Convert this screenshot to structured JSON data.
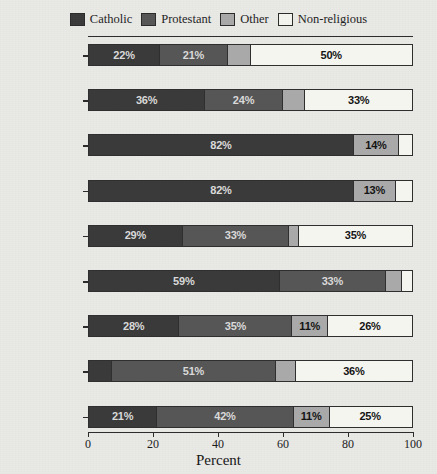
{
  "chart_data": {
    "type": "bar",
    "orientation": "horizontal",
    "stacked": true,
    "stack_mode": "percent",
    "title": "",
    "xlabel": "Percent",
    "ylabel": "",
    "xlim": [
      0,
      100
    ],
    "xticks": [
      "0",
      "20",
      "40",
      "60",
      "80",
      "100"
    ],
    "grid": false,
    "legend_position": "top",
    "categories": [
      "United States",
      "Switzerland",
      "Portugal",
      "Italy",
      "Germany",
      "France",
      "Canada",
      "Britain",
      "Australia"
    ],
    "series": [
      {
        "name": "Catholic",
        "color": "#3a3a3a",
        "values": [
          22,
          36,
          82,
          82,
          29,
          59,
          28,
          7,
          21
        ],
        "labels": [
          "22%",
          "36%",
          "82%",
          "82%",
          "29%",
          "59%",
          "28%",
          "",
          "21%"
        ]
      },
      {
        "name": "Protestant",
        "color": "#565656",
        "values": [
          21,
          24,
          0,
          0,
          33,
          33,
          35,
          51,
          42
        ],
        "labels": [
          "21%",
          "24%",
          "",
          "",
          "33%",
          "33%",
          "35%",
          "51%",
          "42%"
        ]
      },
      {
        "name": "Other",
        "color": "#a9a9a9",
        "values": [
          7,
          7,
          14,
          13,
          3,
          5,
          11,
          6,
          11
        ],
        "labels": [
          "",
          "",
          "14%",
          "13%",
          "",
          "",
          "11%",
          "",
          "11%"
        ]
      },
      {
        "name": "Non-religious",
        "color": "#f5f5f0",
        "values": [
          50,
          33,
          4,
          5,
          35,
          3,
          26,
          36,
          25
        ],
        "labels": [
          "50%",
          "33%",
          "",
          "",
          "35%",
          "",
          "26%",
          "36%",
          "25%"
        ]
      }
    ]
  },
  "legend": {
    "entries": [
      {
        "label": "Catholic",
        "color": "#3a3a3a"
      },
      {
        "label": "Protestant",
        "color": "#565656"
      },
      {
        "label": "Other",
        "color": "#a9a9a9"
      },
      {
        "label": "Non-religious",
        "color": "#f5f5f0"
      }
    ]
  },
  "axis": {
    "x_title": "Percent",
    "x_tick_labels": [
      "0",
      "20",
      "40",
      "60",
      "80",
      "100"
    ],
    "x_tick_values": [
      0,
      20,
      40,
      60,
      80,
      100
    ]
  }
}
